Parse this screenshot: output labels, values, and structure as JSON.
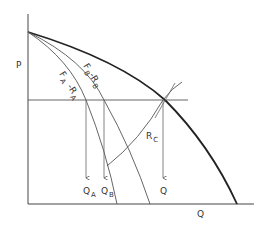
{
  "diagram": {
    "axes": {
      "y_label": "P",
      "x_label": "Q"
    },
    "curves": [
      {
        "id": "aggregate",
        "label": "",
        "style": "bold"
      },
      {
        "id": "fb_rb",
        "label_main": "F",
        "label_sub": "B",
        "label_minus": "-R",
        "label_sub2": "B"
      },
      {
        "id": "fa_ra",
        "label_main": "F",
        "label_sub": "A",
        "label_minus": "-R",
        "label_sub2": "A"
      }
    ],
    "rc_line": {
      "label_main": "R",
      "label_sub": "C"
    },
    "quantity_markers": [
      {
        "main": "Q",
        "sub": "A"
      },
      {
        "main": "Q",
        "sub": "B"
      },
      {
        "main": "Q",
        "sub": ""
      }
    ],
    "colors": {
      "line": "#333333",
      "bold_line": "#222222",
      "background": "#ffffff"
    }
  }
}
